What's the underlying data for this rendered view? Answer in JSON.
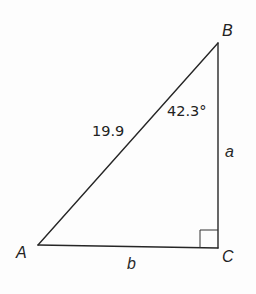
{
  "figure": {
    "type": "right-triangle",
    "vertices": {
      "A": {
        "label": "A"
      },
      "B": {
        "label": "B"
      },
      "C": {
        "label": "C"
      }
    },
    "sides": {
      "hypotenuse_AB": {
        "label": "19.9",
        "value": 19.9
      },
      "side_BC": {
        "label": "a"
      },
      "side_AC": {
        "label": "b"
      }
    },
    "angles": {
      "angle_B": {
        "label": "42.3°",
        "value_degrees": 42.3
      },
      "angle_C": {
        "right_angle": true
      }
    },
    "colors": {
      "line": "#262626",
      "text": "#222222",
      "background": "#fdfdfd"
    }
  }
}
